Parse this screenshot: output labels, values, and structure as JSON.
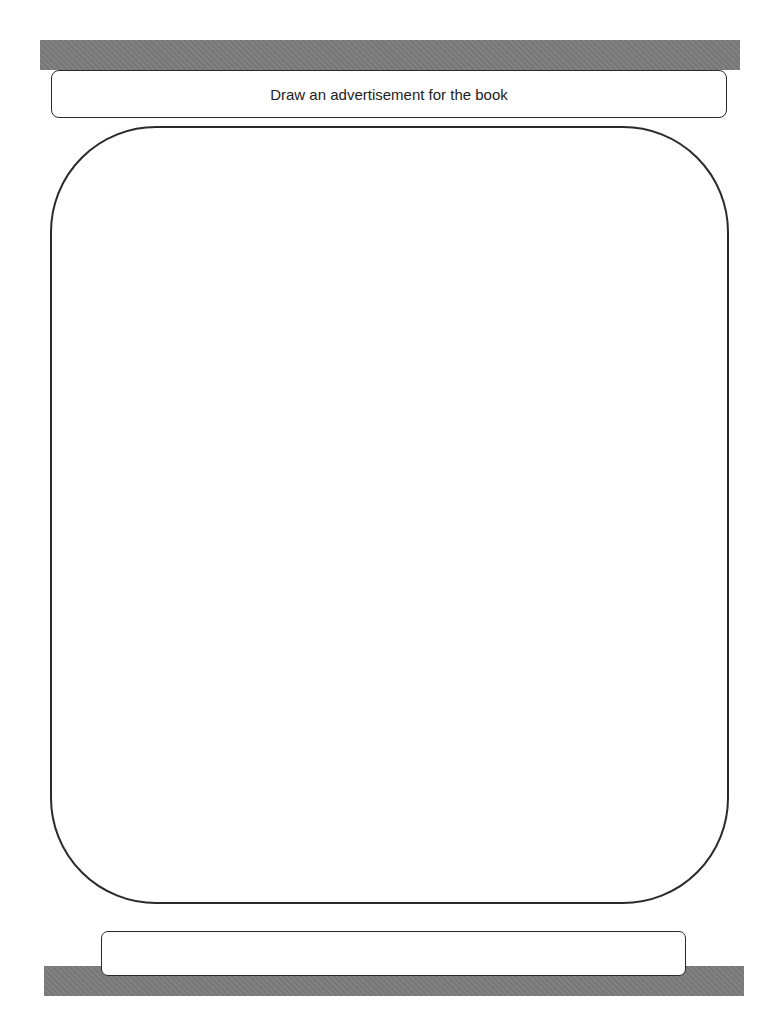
{
  "worksheet": {
    "title": "Draw an advertisement for the book",
    "drawing_area": "",
    "bottom_box": ""
  },
  "colors": {
    "bar": "#7c7c7c",
    "border": "#2a2a2a",
    "background": "#ffffff"
  }
}
